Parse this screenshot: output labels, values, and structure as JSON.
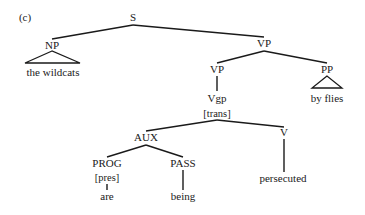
{
  "figure": {
    "panel_label": "(c)",
    "panel_label_pos": {
      "x": 25,
      "y": 21
    }
  },
  "tree": {
    "nodes": [
      {
        "id": "S",
        "label": "S",
        "x": 133,
        "y": 21,
        "kind": "category"
      },
      {
        "id": "NP",
        "label": "NP",
        "x": 52,
        "y": 49,
        "kind": "category"
      },
      {
        "id": "NP_word",
        "label": "the wildcats",
        "x": 53,
        "y": 76,
        "kind": "word"
      },
      {
        "id": "VP1",
        "label": "VP",
        "x": 264,
        "y": 47,
        "kind": "category"
      },
      {
        "id": "VP2",
        "label": "VP",
        "x": 217,
        "y": 73,
        "kind": "category"
      },
      {
        "id": "PP",
        "label": "PP",
        "x": 327,
        "y": 73,
        "kind": "category"
      },
      {
        "id": "PP_word",
        "label": "by flies",
        "x": 327,
        "y": 102,
        "kind": "word"
      },
      {
        "id": "Vgp",
        "label": "Vgp",
        "x": 217,
        "y": 102,
        "kind": "category"
      },
      {
        "id": "Vgp_feat",
        "label": "[trans]",
        "x": 217,
        "y": 117,
        "kind": "feature"
      },
      {
        "id": "AUX",
        "label": "AUX",
        "x": 146,
        "y": 141,
        "kind": "category"
      },
      {
        "id": "V",
        "label": "V",
        "x": 284,
        "y": 136,
        "kind": "category"
      },
      {
        "id": "V_word",
        "label": "persecuted",
        "x": 283,
        "y": 182,
        "kind": "word"
      },
      {
        "id": "PROG",
        "label": "PROG",
        "x": 107,
        "y": 167,
        "kind": "category"
      },
      {
        "id": "PROG_feat",
        "label": "[pres]",
        "x": 107,
        "y": 181,
        "kind": "feature"
      },
      {
        "id": "PROG_word",
        "label": "are",
        "x": 107,
        "y": 200,
        "kind": "word"
      },
      {
        "id": "PASS",
        "label": "PASS",
        "x": 183,
        "y": 167,
        "kind": "category"
      },
      {
        "id": "PASS_word",
        "label": "being",
        "x": 183,
        "y": 200,
        "kind": "word"
      }
    ],
    "edges": [
      {
        "from": "S",
        "to": "NP",
        "x1": 133,
        "y1": 25,
        "x2": 52,
        "y2": 39
      },
      {
        "from": "S",
        "to": "VP1",
        "x1": 133,
        "y1": 25,
        "x2": 264,
        "y2": 37
      },
      {
        "from": "VP1",
        "to": "VP2",
        "x1": 264,
        "y1": 51,
        "x2": 217,
        "y2": 63
      },
      {
        "from": "VP1",
        "to": "PP",
        "x1": 264,
        "y1": 51,
        "x2": 327,
        "y2": 63
      },
      {
        "from": "VP2",
        "to": "Vgp",
        "x1": 217,
        "y1": 76,
        "x2": 217,
        "y2": 91
      },
      {
        "from": "Vgp",
        "to": "AUX",
        "x1": 217,
        "y1": 120,
        "x2": 146,
        "y2": 131
      },
      {
        "from": "Vgp",
        "to": "V",
        "x1": 217,
        "y1": 120,
        "x2": 284,
        "y2": 127
      },
      {
        "from": "AUX",
        "to": "PROG",
        "x1": 146,
        "y1": 145,
        "x2": 107,
        "y2": 157
      },
      {
        "from": "AUX",
        "to": "PASS",
        "x1": 146,
        "y1": 145,
        "x2": 183,
        "y2": 157
      },
      {
        "from": "V",
        "to": "persecuted",
        "x1": 284,
        "y1": 139,
        "x2": 284,
        "y2": 172
      },
      {
        "from": "PASS",
        "to": "being",
        "x1": 183,
        "y1": 170,
        "x2": 183,
        "y2": 190
      },
      {
        "from": "PROG_feat",
        "to": "are",
        "x1": 107,
        "y1": 184,
        "x2": 107,
        "y2": 190
      }
    ],
    "triangles": [
      {
        "under": "NP",
        "apex": [
          52,
          51
        ],
        "left": [
          25,
          63
        ],
        "right": [
          80,
          63
        ]
      },
      {
        "under": "PP",
        "apex": [
          327,
          76
        ],
        "left": [
          312,
          88
        ],
        "right": [
          342,
          88
        ]
      }
    ]
  }
}
